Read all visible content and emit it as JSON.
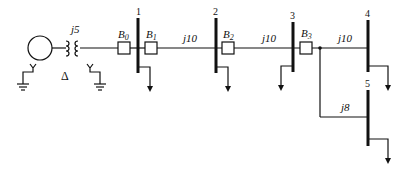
{
  "diagram": {
    "type": "one-line power system diagram",
    "generator": {
      "label": ""
    },
    "transformer": {
      "impedance_label": "j5",
      "primary_connection": "Δ",
      "secondary_connection": "Y grounded",
      "generator_side_connection": "Y grounded"
    },
    "buses": [
      {
        "id": "1",
        "label": "1"
      },
      {
        "id": "2",
        "label": "2"
      },
      {
        "id": "3",
        "label": "3"
      },
      {
        "id": "4",
        "label": "4"
      },
      {
        "id": "5",
        "label": "5"
      }
    ],
    "breakers": [
      {
        "id": "B0",
        "base": "B",
        "sub": "0"
      },
      {
        "id": "B1",
        "base": "B",
        "sub": "1"
      },
      {
        "id": "B2",
        "base": "B",
        "sub": "2"
      },
      {
        "id": "B3",
        "base": "B",
        "sub": "3"
      }
    ],
    "lines": [
      {
        "from": "1",
        "to": "2",
        "label": "j10"
      },
      {
        "from": "2",
        "to": "3",
        "label": "j10"
      },
      {
        "from": "3",
        "to": "4",
        "label": "j10"
      },
      {
        "from": "3",
        "to": "5",
        "label": "j8"
      }
    ],
    "delta_symbol": "Δ",
    "loads": [
      "bus1",
      "bus2",
      "bus3",
      "bus4",
      "bus5"
    ]
  }
}
